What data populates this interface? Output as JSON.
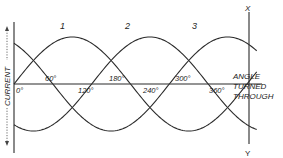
{
  "diagram": {
    "y_axis_label": "CURRENT",
    "x_axis_label_lines": [
      "ANGLE",
      "TURNED",
      "THROUGH"
    ],
    "marker_line_top": "X",
    "marker_line_bottom": "Y",
    "curve_labels": [
      "1",
      "2",
      "3"
    ],
    "angle_labels_above": [
      "60°",
      "180°",
      "300°"
    ],
    "angle_labels_below": [
      "0°",
      "120°",
      "240°",
      "360°"
    ],
    "colors": {
      "line": "#2a2a2a",
      "background": "#ffffff"
    }
  }
}
